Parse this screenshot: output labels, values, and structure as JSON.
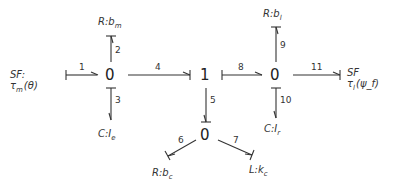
{
  "junctions": {
    "j0_left": "0",
    "j1": "1",
    "j0_bottom": "0",
    "j0_right": "0"
  },
  "bonds": {
    "b1": "1",
    "b2": "2",
    "b3": "3",
    "b4": "4",
    "b5": "5",
    "b6": "6",
    "b7": "7",
    "b8": "8",
    "b9": "9",
    "b10": "10",
    "b11": "11"
  },
  "elements": {
    "sf_in": {
      "type": "SF:",
      "param": "τ",
      "sub": "m",
      "arg": "(θ)"
    },
    "r_bm": {
      "type": "R:",
      "param": "b",
      "sub": "m"
    },
    "c_ie": {
      "type": "C:",
      "param": "I",
      "sub": "e"
    },
    "r_bc": {
      "type": "R:",
      "param": "b",
      "sub": "c"
    },
    "l_kc": {
      "type": "L:",
      "param": "k",
      "sub": "c"
    },
    "r_bl": {
      "type": "R:",
      "param": "b",
      "sub": "l"
    },
    "c_ir": {
      "type": "C:",
      "param": "I",
      "sub": "r"
    },
    "sf_out": {
      "type": "SF",
      "param": "τ",
      "sub": "l",
      "arg": "(ψ_f)"
    }
  },
  "colors": {
    "stroke": "#333333",
    "background": "#ffffff"
  }
}
